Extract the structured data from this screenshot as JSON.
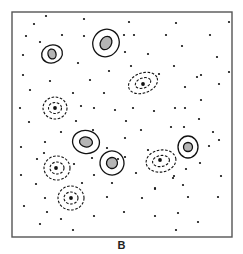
{
  "figure": {
    "panel_label": "B",
    "frame": {
      "x": 12,
      "y": 12,
      "w": 220,
      "h": 225,
      "stroke": "#555555"
    },
    "colors": {
      "ink": "#111111",
      "fill": "#b5b5b5",
      "frame": "#555555"
    },
    "dots": [
      [
        46,
        16
      ],
      [
        34,
        24
      ],
      [
        84,
        19
      ],
      [
        129,
        22
      ],
      [
        176,
        23
      ],
      [
        229,
        22
      ],
      [
        26,
        36
      ],
      [
        62,
        35
      ],
      [
        84,
        36
      ],
      [
        124,
        35
      ],
      [
        134,
        35
      ],
      [
        166,
        35
      ],
      [
        210,
        35
      ],
      [
        40,
        42
      ],
      [
        23,
        55
      ],
      [
        125,
        52
      ],
      [
        148,
        54
      ],
      [
        182,
        46
      ],
      [
        217,
        57
      ],
      [
        78,
        63
      ],
      [
        109,
        71
      ],
      [
        131,
        66
      ],
      [
        159,
        74
      ],
      [
        174,
        66
      ],
      [
        197,
        77
      ],
      [
        201,
        75
      ],
      [
        229,
        72
      ],
      [
        23,
        75
      ],
      [
        50,
        81
      ],
      [
        90,
        80
      ],
      [
        219,
        84
      ],
      [
        30,
        90
      ],
      [
        73,
        93
      ],
      [
        104,
        93
      ],
      [
        185,
        87
      ],
      [
        201,
        100
      ],
      [
        20,
        108
      ],
      [
        81,
        106
      ],
      [
        94,
        108
      ],
      [
        115,
        110
      ],
      [
        133,
        108
      ],
      [
        154,
        111
      ],
      [
        175,
        108
      ],
      [
        185,
        108
      ],
      [
        29,
        122
      ],
      [
        76,
        121
      ],
      [
        126,
        121
      ],
      [
        199,
        119
      ],
      [
        171,
        127
      ],
      [
        184,
        127
      ],
      [
        61,
        132
      ],
      [
        93,
        130
      ],
      [
        125,
        138
      ],
      [
        141,
        130
      ],
      [
        213,
        132
      ],
      [
        219,
        140
      ],
      [
        21,
        147
      ],
      [
        45,
        142
      ],
      [
        107,
        148
      ],
      [
        44,
        153
      ],
      [
        37,
        159
      ],
      [
        125,
        157
      ],
      [
        148,
        150
      ],
      [
        209,
        146
      ],
      [
        74,
        164
      ],
      [
        92,
        158
      ],
      [
        118,
        159
      ],
      [
        200,
        163
      ],
      [
        21,
        175
      ],
      [
        94,
        175
      ],
      [
        136,
        173
      ],
      [
        174,
        176
      ],
      [
        186,
        169
      ],
      [
        221,
        176
      ],
      [
        36,
        184
      ],
      [
        82,
        183
      ],
      [
        112,
        183
      ],
      [
        155,
        189
      ],
      [
        173,
        178
      ],
      [
        183,
        185
      ],
      [
        45,
        198
      ],
      [
        107,
        197
      ],
      [
        142,
        198
      ],
      [
        155,
        188
      ],
      [
        188,
        197
      ],
      [
        218,
        197
      ],
      [
        24,
        206
      ],
      [
        47,
        212
      ],
      [
        61,
        219
      ],
      [
        94,
        216
      ],
      [
        124,
        212
      ],
      [
        155,
        216
      ],
      [
        178,
        213
      ],
      [
        198,
        222
      ],
      [
        40,
        224
      ],
      [
        73,
        230
      ],
      [
        176,
        230
      ]
    ],
    "solid_contours": [
      {
        "name": "blob-1",
        "cx": 52,
        "cy": 54,
        "outer": [
          21,
          18,
          -15
        ],
        "inner": [
          8,
          10,
          -15
        ]
      },
      {
        "name": "blob-2",
        "cx": 106,
        "cy": 43,
        "outer": [
          26,
          28,
          30
        ],
        "inner": [
          11,
          14,
          30
        ]
      },
      {
        "name": "blob-3",
        "cx": 86,
        "cy": 142,
        "outer": [
          27,
          23,
          10
        ],
        "inner": [
          13,
          10,
          10
        ]
      },
      {
        "name": "blob-4",
        "cx": 112,
        "cy": 163,
        "outer": [
          24,
          24,
          -30
        ],
        "inner": [
          11,
          11,
          -30
        ]
      },
      {
        "name": "blob-5",
        "cx": 188,
        "cy": 147,
        "outer": [
          20,
          22,
          0
        ],
        "inner": [
          9,
          9,
          0
        ]
      }
    ],
    "dashed_contours": [
      {
        "name": "dashed-1",
        "cx": 143,
        "cy": 83,
        "rings": [
          [
            30,
            20,
            -20
          ],
          [
            16,
            10,
            -20
          ]
        ]
      },
      {
        "name": "dashed-2",
        "cx": 55,
        "cy": 108,
        "rings": [
          [
            24,
            22,
            0
          ],
          [
            13,
            11,
            0
          ]
        ]
      },
      {
        "name": "dashed-3",
        "cx": 57,
        "cy": 168,
        "rings": [
          [
            26,
            24,
            0
          ],
          [
            14,
            12,
            0
          ]
        ]
      },
      {
        "name": "dashed-4",
        "cx": 71,
        "cy": 198,
        "rings": [
          [
            26,
            24,
            0
          ],
          [
            14,
            12,
            0
          ]
        ]
      },
      {
        "name": "dashed-5",
        "cx": 161,
        "cy": 161,
        "rings": [
          [
            30,
            22,
            -10
          ],
          [
            17,
            11,
            -10
          ]
        ]
      }
    ],
    "dashed_centers": [
      [
        143,
        84
      ],
      [
        55,
        108
      ],
      [
        56,
        168
      ],
      [
        71,
        198
      ],
      [
        160,
        160
      ]
    ]
  }
}
